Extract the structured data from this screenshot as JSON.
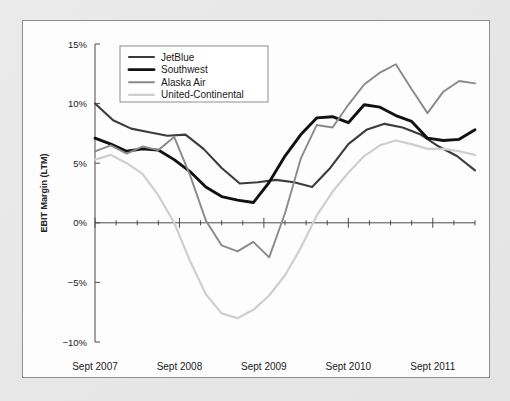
{
  "chart_data": {
    "type": "line",
    "title": "",
    "xlabel": "",
    "ylabel": "EBIT Margin (LTM)",
    "ylim": [
      -10,
      15
    ],
    "ytick_labels": [
      "15%",
      "10%",
      "5%",
      "0%",
      "−5%",
      "−10%"
    ],
    "ytick_values": [
      15,
      10,
      5,
      0,
      -5,
      -10
    ],
    "xtick_labels": [
      "Sept 2007",
      "Sept 2008",
      "Sept 2009",
      "Sept 2010",
      "Sept 2011"
    ],
    "xtick_values": [
      0,
      4,
      8,
      12,
      16
    ],
    "xlim": [
      0,
      18
    ],
    "grid": false,
    "legend_position": "top-left",
    "x_minor_ticks_per_interval": 4,
    "series": [
      {
        "name": "JetBlue",
        "color": "#3c3c3c",
        "width": 2.1,
        "values": [
          10.0,
          8.6,
          7.9,
          7.6,
          7.3,
          7.4,
          6.2,
          4.6,
          3.3,
          3.4,
          3.6,
          3.4,
          3.0,
          4.6,
          6.6,
          7.8,
          8.3,
          8.0,
          7.4,
          6.4,
          5.6,
          4.4
        ]
      },
      {
        "name": "Southwest",
        "color": "#111111",
        "width": 2.9,
        "values": [
          7.1,
          6.6,
          6.0,
          6.2,
          6.1,
          5.3,
          4.3,
          3.0,
          2.2,
          1.9,
          1.7,
          3.4,
          5.6,
          7.4,
          8.8,
          8.9,
          8.4,
          9.9,
          9.7,
          9.0,
          8.5,
          7.1,
          6.9,
          7.0,
          7.8
        ]
      },
      {
        "name": "Alaska Air",
        "color": "#8a8a8a",
        "width": 1.9,
        "values": [
          6.0,
          6.5,
          5.8,
          6.4,
          6.1,
          7.2,
          4.0,
          0.2,
          -1.9,
          -2.4,
          -1.6,
          -2.9,
          0.8,
          5.4,
          8.2,
          8.0,
          9.9,
          11.6,
          12.6,
          13.3,
          11.2,
          9.2,
          11.0,
          11.9,
          11.7
        ]
      },
      {
        "name": "United-Continental",
        "color": "#cfcfcf",
        "width": 2.2,
        "values": [
          5.3,
          5.7,
          5.0,
          4.1,
          2.3,
          0.0,
          -3.2,
          -6.0,
          -7.6,
          -8.0,
          -7.3,
          -6.1,
          -4.4,
          -2.1,
          0.6,
          2.6,
          4.2,
          5.6,
          6.5,
          6.9,
          6.6,
          6.2,
          6.2,
          6.0,
          5.7
        ]
      }
    ]
  },
  "legend": {
    "entries": [
      {
        "label": "JetBlue"
      },
      {
        "label": "Southwest"
      },
      {
        "label": "Alaska Air"
      },
      {
        "label": "United-Continental"
      }
    ]
  }
}
